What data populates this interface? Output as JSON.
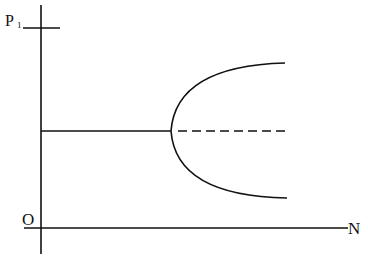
{
  "diagram": {
    "type": "bifurcation-diagram",
    "axes": {
      "y_label": "P",
      "y_label_subscript": "1",
      "x_label": "N",
      "origin_label": "O"
    },
    "curves": [
      {
        "name": "stable-branch-before",
        "style": "solid",
        "description": "horizontal line from axis to bifurcation point"
      },
      {
        "name": "unstable-branch-after",
        "style": "dashed",
        "description": "horizontal continuation after bifurcation point"
      },
      {
        "name": "parabolic-branches",
        "style": "solid",
        "description": "upper and lower branches opening to the right"
      }
    ],
    "colors": {
      "line": "#111111",
      "background": "#ffffff"
    }
  }
}
